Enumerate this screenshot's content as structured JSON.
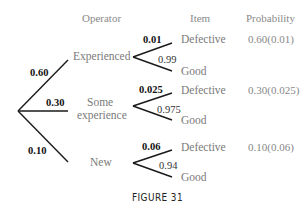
{
  "headers": {
    "operator": "Operator",
    "item": "Item",
    "probability": "Probability"
  },
  "operators": [
    {
      "label": "Experienced",
      "branch_prob": "0.60",
      "defective_prob": "0.01",
      "good_prob": "0.99",
      "defective_label": "Defective",
      "good_label": "Good",
      "result": "0.60(0.01)"
    },
    {
      "label_line1": "Some",
      "label_line2": "experience",
      "branch_prob": "0.30",
      "defective_prob": "0.025",
      "good_prob": "0.975",
      "defective_label": "Defective",
      "good_label": "Good",
      "result": "0.30(0.025)"
    },
    {
      "label": "New",
      "branch_prob": "0.10",
      "defective_prob": "0.06",
      "good_prob": "0.94",
      "defective_label": "Defective",
      "good_label": "Good",
      "result": "0.10(0.06)"
    }
  ],
  "caption": "FIGURE 31"
}
